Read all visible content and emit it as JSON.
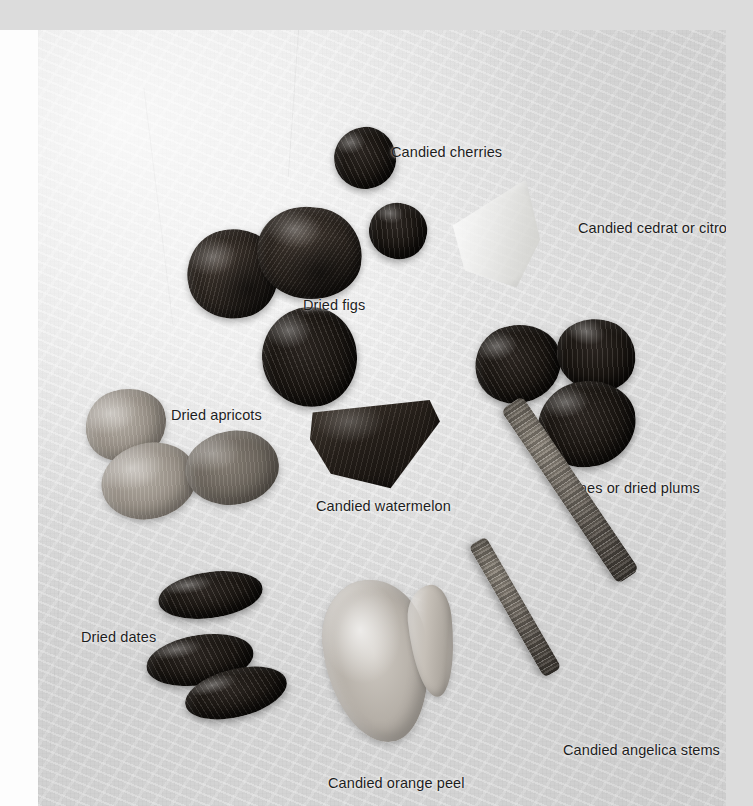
{
  "page": {
    "media_type": "photograph"
  },
  "colors": {
    "outer_background": "#dcdcdc",
    "page_background": "#fdfdfd",
    "photo_background": "#e7e7e7",
    "label_text": "#1d1d1d",
    "dark_fruit": "#2e2721",
    "darkest_fruit": "#16120f",
    "mid_fruit": "#9b9389",
    "pale_fruit": "#b4aea6",
    "stem": "#7a736a"
  },
  "labels": [
    {
      "id": "candied-cherries",
      "text": "Candied cherries"
    },
    {
      "id": "candied-cedrat",
      "text": "Candied cedrat or citron"
    },
    {
      "id": "dried-figs",
      "text": "Dried figs"
    },
    {
      "id": "dried-apricots",
      "text": "Dried apricots"
    },
    {
      "id": "prunes",
      "text": "Prunes or dried plums"
    },
    {
      "id": "candied-watermelon",
      "text": "Candied watermelon"
    },
    {
      "id": "dried-dates",
      "text": "Dried dates"
    },
    {
      "id": "candied-angelica",
      "text": "Candied angelica stems"
    },
    {
      "id": "candied-orange-peel",
      "text": "Candied orange peel"
    }
  ],
  "specimens": [
    {
      "group": "Candied cherries",
      "count": 2,
      "appearance": "dark glossy rounded spheres"
    },
    {
      "group": "Candied cedrat or citron",
      "count": 1,
      "appearance": "pale translucent wedge-shaped slab"
    },
    {
      "group": "Dried figs",
      "count": 3,
      "appearance": "dark wrinkled flattened rounds"
    },
    {
      "group": "Dried apricots",
      "count": 3,
      "appearance": "mid-tone puckered ovals"
    },
    {
      "group": "Prunes or dried plums",
      "count": 3,
      "appearance": "very dark wrinkled lumps"
    },
    {
      "group": "Candied watermelon",
      "count": 1,
      "appearance": "dark triangular wedge"
    },
    {
      "group": "Dried dates",
      "count": 3,
      "appearance": "dark glossy elongated ovals"
    },
    {
      "group": "Candied angelica stems",
      "count": 2,
      "appearance": "long ribbed diagonal batons"
    },
    {
      "group": "Candied orange peel",
      "count": 2,
      "appearance": "large pale oval plus a thin curved sliver"
    }
  ]
}
